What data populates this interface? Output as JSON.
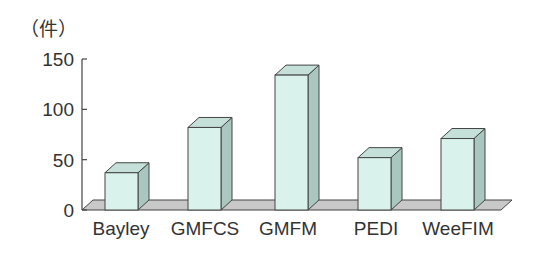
{
  "chart_data": {
    "type": "bar",
    "title": "",
    "unit_label": "（件）",
    "xlabel": "",
    "ylabel": "（件）",
    "categories": [
      "Bayley",
      "GMFCS",
      "GMFM",
      "PEDI",
      "WeeFIM"
    ],
    "values": [
      37,
      82,
      134,
      52,
      71
    ],
    "yticks": [
      "0",
      "50",
      "100",
      "150"
    ],
    "ylim": [
      0,
      150
    ],
    "grid": false,
    "legend": null,
    "style": "3d-bar",
    "colors": {
      "bar_front": "#d9f3ec",
      "bar_side": "#a9c7bf",
      "bar_top": "#c4e0d8",
      "floor": "#c8c8c8",
      "stroke": "#444444"
    }
  }
}
